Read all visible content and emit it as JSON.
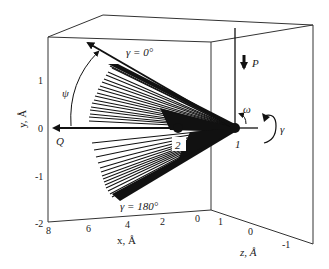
{
  "diagram": {
    "type": "3d-molecular-geometry-fan",
    "axes": {
      "y": {
        "label": "y, Å",
        "ticks": [
          "1",
          "0",
          "-1",
          "-2"
        ]
      },
      "x": {
        "label": "x, Å",
        "ticks": [
          "8",
          "6",
          "4",
          "2",
          "0"
        ]
      },
      "z": {
        "label": "z, Å",
        "ticks": [
          "1",
          "0",
          "-1"
        ]
      }
    },
    "annotations": {
      "gamma_top": "γ = 0°",
      "gamma_bottom": "γ = 180°",
      "psi": "ψ",
      "omega": "ω",
      "gamma_rot": "γ",
      "force": "P",
      "q_label": "Q",
      "point1": "1",
      "point2": "2"
    },
    "colors": {
      "lines": "#111111",
      "box": "#333333",
      "background": "#ffffff"
    }
  }
}
